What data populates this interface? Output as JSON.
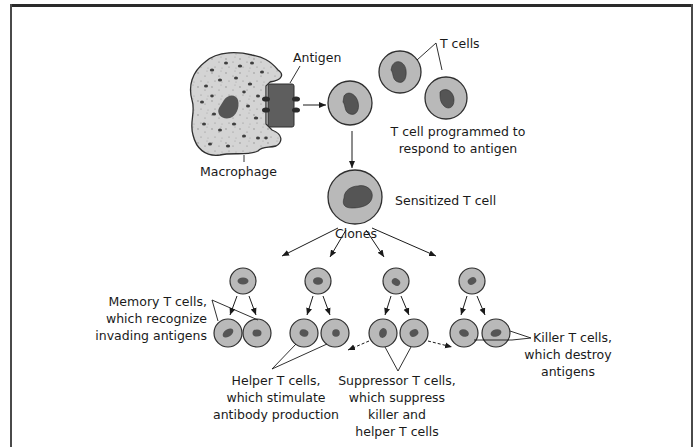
{
  "figure": {
    "colors": {
      "cell_fill": "#b9b9b9",
      "cell_stroke": "#2f2f2f",
      "nucleus": "#555555",
      "macrophage_fill": "#d2d2d2",
      "antigen_fill": "#5e5e5e",
      "frame": "#2a2a2a"
    }
  },
  "labels": {
    "antigen": "Antigen",
    "macrophage": "Macrophage",
    "t_cells": "T cells",
    "programmed_line1": "T cell programmed to",
    "programmed_line2": "respond to antigen",
    "sensitized": "Sensitized T cell",
    "clones": "Clones",
    "memory_line1": "Memory T cells,",
    "memory_line2": "which recognize",
    "memory_line3": "invading antigens",
    "helper_line1": "Helper T cells,",
    "helper_line2": "which stimulate",
    "helper_line3": "antibody production",
    "suppressor_line1": "Suppressor T cells,",
    "suppressor_line2": "which suppress",
    "suppressor_line3": "killer and",
    "suppressor_line4": "helper T cells",
    "killer_line1": "Killer T cells,",
    "killer_line2": "which destroy",
    "killer_line3": "antigens"
  },
  "nodes": [
    {
      "id": "macrophage",
      "label": "Macrophage"
    },
    {
      "id": "antigen",
      "label": "Antigen"
    },
    {
      "id": "t-cell-programmed",
      "label": "T cell programmed to respond to antigen"
    },
    {
      "id": "t-cells",
      "label": "T cells"
    },
    {
      "id": "sensitized-t-cell",
      "label": "Sensitized T cell"
    },
    {
      "id": "memory-t-cells",
      "label": "Memory T cells, which recognize invading antigens"
    },
    {
      "id": "helper-t-cells",
      "label": "Helper T cells, which stimulate antibody production"
    },
    {
      "id": "suppressor-t-cells",
      "label": "Suppressor T cells, which suppress killer and helper T cells"
    },
    {
      "id": "killer-t-cells",
      "label": "Killer T cells, which destroy antigens"
    }
  ],
  "edges": [
    {
      "from": "antigen",
      "to": "t-cell-programmed"
    },
    {
      "from": "t-cell-programmed",
      "to": "sensitized-t-cell"
    },
    {
      "from": "sensitized-t-cell",
      "to": "memory-t-cells",
      "label": "Clones"
    },
    {
      "from": "sensitized-t-cell",
      "to": "helper-t-cells",
      "label": "Clones"
    },
    {
      "from": "sensitized-t-cell",
      "to": "suppressor-t-cells",
      "label": "Clones"
    },
    {
      "from": "sensitized-t-cell",
      "to": "killer-t-cells",
      "label": "Clones"
    },
    {
      "from": "suppressor-t-cells",
      "to": "helper-t-cells",
      "style": "dashed"
    },
    {
      "from": "suppressor-t-cells",
      "to": "killer-t-cells",
      "style": "dashed"
    }
  ]
}
